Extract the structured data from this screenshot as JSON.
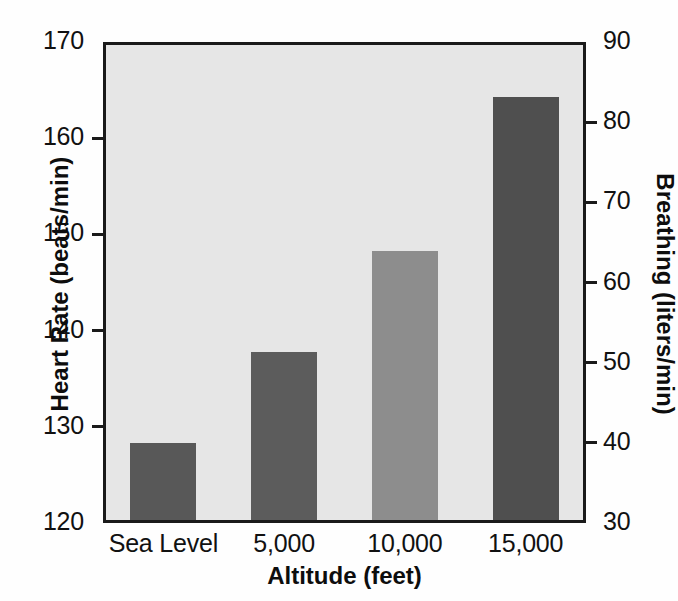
{
  "chart_data": {
    "type": "bar",
    "title": "",
    "subtitle": "",
    "xlabel": "Altitude (feet)",
    "ylabel": "Heart Rate (beats/min)",
    "ylabel_right": "Breathing (liters/min)",
    "categories": [
      "Sea Level",
      "5,000",
      "10,000",
      "15,000"
    ],
    "series": [
      {
        "name": "Heart Rate (beats/min)",
        "axis": "left",
        "values": [
          128,
          137.5,
          148,
          164
        ]
      },
      {
        "name": "Breathing (liters/min)",
        "axis": "right",
        "values": [
          39.6,
          45.5,
          53.6,
          72.4
        ]
      }
    ],
    "values": [
      128,
      137.5,
      148,
      164
    ],
    "ylim": [
      120,
      170
    ],
    "ylim_right": [
      30,
      90
    ],
    "yticks": [
      120,
      130,
      140,
      150,
      160,
      170
    ],
    "yticks_right": [
      30,
      40,
      50,
      60,
      70,
      80,
      90
    ],
    "ytick_labels": [
      "120",
      "130",
      "140",
      "150",
      "160",
      "170"
    ],
    "ytick_labels_right": [
      "30",
      "40",
      "50",
      "60",
      "70",
      "80",
      "90"
    ],
    "grid": false,
    "legend": false,
    "legend_position": "none",
    "bar_colors": [
      "#585858",
      "#5c5c5c",
      "#8d8d8d",
      "#4f4f4f"
    ],
    "plot_background": "#e6e6e6",
    "axis_color": "#1a1a1a",
    "bar_width_px": 66,
    "bar_value_labels": []
  },
  "axes": {
    "left": {
      "title": "Heart Rate (beats/min)",
      "ticks": [
        {
          "label": "170",
          "value": 170
        },
        {
          "label": "160",
          "value": 160
        },
        {
          "label": "150",
          "value": 150
        },
        {
          "label": "140",
          "value": 140
        },
        {
          "label": "130",
          "value": 130
        },
        {
          "label": "120",
          "value": 120
        }
      ]
    },
    "right": {
      "title": "Breathing (liters/min)",
      "ticks": [
        {
          "label": "90",
          "value": 90
        },
        {
          "label": "80",
          "value": 80
        },
        {
          "label": "70",
          "value": 70
        },
        {
          "label": "60",
          "value": 60
        },
        {
          "label": "50",
          "value": 50
        },
        {
          "label": "40",
          "value": 40
        },
        {
          "label": "30",
          "value": 30
        }
      ]
    },
    "bottom": {
      "title": "Altitude (feet)",
      "ticks": [
        {
          "label": "Sea Level"
        },
        {
          "label": "5,000"
        },
        {
          "label": "10,000"
        },
        {
          "label": "15,000"
        }
      ]
    }
  }
}
